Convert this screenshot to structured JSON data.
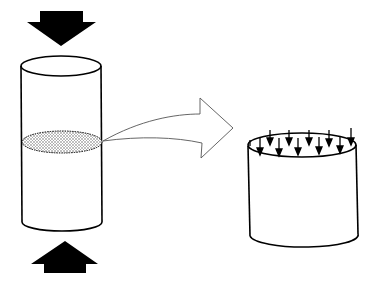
{
  "diagram": {
    "colors": {
      "background": "#ffffff",
      "ink": "#000000",
      "section_fill": "#cfcfcf"
    },
    "elements": {
      "top_force_arrow": {
        "icon": "down-arrow-icon",
        "direction": "down"
      },
      "bottom_force_arrow": {
        "icon": "up-arrow-icon",
        "direction": "up"
      },
      "full_cylinder": {
        "label": ""
      },
      "cross_section": {
        "fill": "stippled"
      },
      "transition_arrow": {
        "icon": "curved-right-arrow-icon",
        "style": "outline"
      },
      "cut_segment": {
        "stress_arrow_count": 11
      }
    }
  }
}
